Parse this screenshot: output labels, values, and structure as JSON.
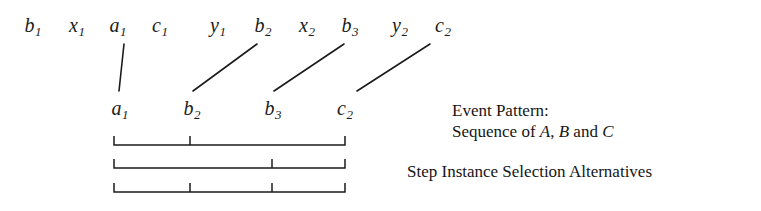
{
  "figure": {
    "width": 761,
    "height": 211,
    "background": "#ffffff",
    "ink_color": "#1b1b1b"
  },
  "event_stream": {
    "description": "Top row of incoming event instances in arrival order",
    "items": [
      {
        "base": "b",
        "sub": "1",
        "x": 33,
        "y": 15,
        "selected": false
      },
      {
        "base": "x",
        "sub": "1",
        "x": 77,
        "y": 15,
        "selected": false
      },
      {
        "base": "a",
        "sub": "1",
        "x": 118,
        "y": 15,
        "selected": true
      },
      {
        "base": "c",
        "sub": "1",
        "x": 160,
        "y": 15,
        "selected": false
      },
      {
        "base": "y",
        "sub": "1",
        "x": 218,
        "y": 15,
        "selected": false
      },
      {
        "base": "b",
        "sub": "2",
        "x": 263,
        "y": 15,
        "selected": true
      },
      {
        "base": "x",
        "sub": "2",
        "x": 307,
        "y": 15,
        "selected": false
      },
      {
        "base": "b",
        "sub": "3",
        "x": 350,
        "y": 15,
        "selected": true
      },
      {
        "base": "y",
        "sub": "2",
        "x": 400,
        "y": 15,
        "selected": false
      },
      {
        "base": "c",
        "sub": "2",
        "x": 443,
        "y": 15,
        "selected": true
      }
    ]
  },
  "selected_events": {
    "description": "Second row: events matched by the pattern",
    "items": [
      {
        "base": "a",
        "sub": "1",
        "x": 120,
        "y": 98
      },
      {
        "base": "b",
        "sub": "2",
        "x": 192,
        "y": 98
      },
      {
        "base": "b",
        "sub": "3",
        "x": 273,
        "y": 98
      },
      {
        "base": "c",
        "sub": "2",
        "x": 345,
        "y": 98
      }
    ]
  },
  "connectors": [
    {
      "x1": 124,
      "y1": 44,
      "x2": 119,
      "y2": 91,
      "from": "a1",
      "to": "a1"
    },
    {
      "x1": 193,
      "y1": 91,
      "x2": 257,
      "y2": 44,
      "from": "b2",
      "to": "b2"
    },
    {
      "x1": 274,
      "y1": 91,
      "x2": 344,
      "y2": 44,
      "from": "b3",
      "to": "b3"
    },
    {
      "x1": 357,
      "y1": 91,
      "x2": 430,
      "y2": 44,
      "from": "c2",
      "to": "c2"
    }
  ],
  "brackets": {
    "description": "Three step instance selection alternatives drawn as brackets",
    "left": 114,
    "right": 345,
    "tick_top_offset": 9,
    "rows": [
      {
        "y": 145,
        "ticks": [
          190
        ],
        "label": "alternative-1"
      },
      {
        "y": 168,
        "ticks": [
          272
        ],
        "label": "alternative-2"
      },
      {
        "y": 192,
        "ticks": [
          190,
          272
        ],
        "label": "alternative-3"
      }
    ]
  },
  "annotations": {
    "event_pattern_title": "Event Pattern:",
    "event_pattern_line_prefix": "Sequence of ",
    "event_pattern_a": "A",
    "event_pattern_comma": ", ",
    "event_pattern_b": "B",
    "event_pattern_and": " and ",
    "event_pattern_c": "C",
    "selection_alternatives": "Step Instance Selection Alternatives"
  }
}
